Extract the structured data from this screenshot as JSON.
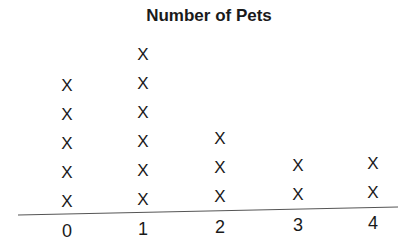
{
  "chart_data": {
    "type": "dot-plot",
    "title": "Number of Pets",
    "xlabel": "",
    "ylabel": "",
    "categories": [
      "0",
      "1",
      "2",
      "3",
      "4"
    ],
    "values": [
      5,
      6,
      3,
      2,
      2
    ],
    "marker": "X",
    "grid": false,
    "legend": null
  },
  "layout": {
    "tick_x": [
      67,
      143,
      220,
      298,
      373
    ],
    "tick_y": [
      222,
      220,
      218,
      216,
      214
    ],
    "mark_base_y": [
      193,
      191,
      188,
      186,
      184
    ],
    "mark_spacing": 29,
    "axis_line": {
      "x1": 18,
      "y1": 215,
      "x2": 398,
      "y2": 207,
      "color": "#555555"
    }
  }
}
